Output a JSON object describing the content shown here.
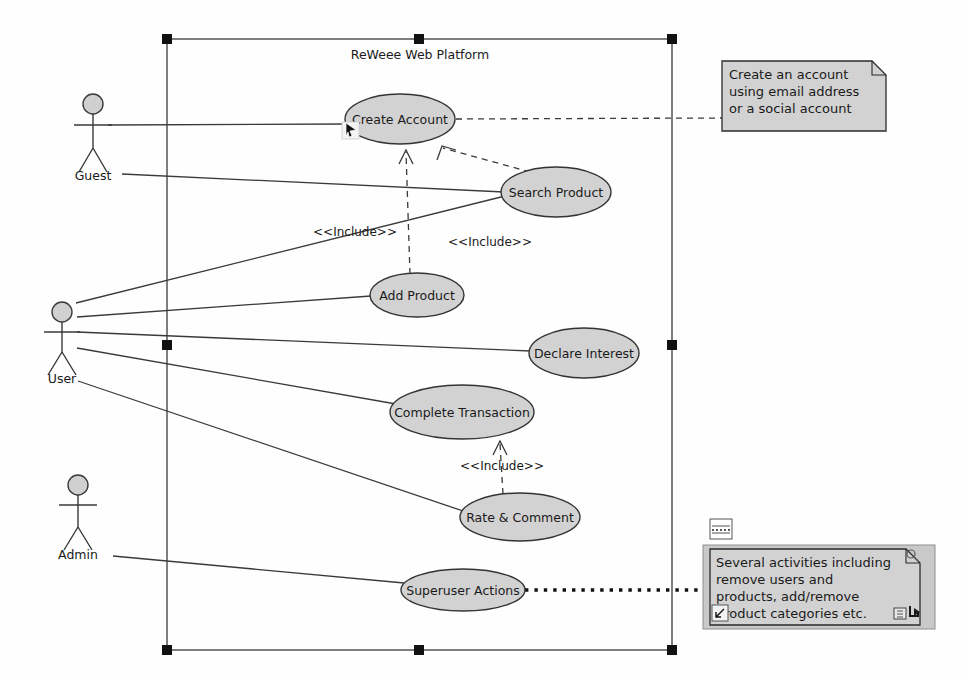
{
  "diagram": {
    "type": "uml-use-case-diagram",
    "system_boundary": {
      "title": "ReWeee Web Platform",
      "selected": true,
      "handles": 8
    },
    "actors": [
      {
        "id": "guest",
        "label": "Guest",
        "x": 93,
        "y": 98
      },
      {
        "id": "user",
        "label": "User",
        "x": 60,
        "y": 305
      },
      {
        "id": "admin",
        "label": "Admin",
        "x": 78,
        "y": 505
      }
    ],
    "use_cases": [
      {
        "id": "create-account",
        "label": "Create Account",
        "cx": 400,
        "cy": 119,
        "rx": 55,
        "ry": 25
      },
      {
        "id": "search-product",
        "label": "Search Product",
        "cx": 556,
        "cy": 192,
        "rx": 55,
        "ry": 25
      },
      {
        "id": "add-product",
        "label": "Add Product",
        "cx": 417,
        "cy": 295,
        "rx": 47,
        "ry": 22
      },
      {
        "id": "declare-interest",
        "label": "Declare Interest",
        "cx": 584,
        "cy": 353,
        "rx": 55,
        "ry": 25
      },
      {
        "id": "complete-transaction",
        "label": "Complete Transaction",
        "cx": 462,
        "cy": 412,
        "rx": 72,
        "ry": 27
      },
      {
        "id": "rate-comment",
        "label": "Rate & Comment",
        "cx": 520,
        "cy": 517,
        "rx": 60,
        "ry": 24
      },
      {
        "id": "superuser-actions",
        "label": "Superuser Actions",
        "cx": 463,
        "cy": 590,
        "rx": 62,
        "ry": 21
      }
    ],
    "include_labels": [
      {
        "id": "include-add-product-create-account",
        "text": "<<Include>>",
        "x": 355,
        "y": 232
      },
      {
        "id": "include-search-product-create-account",
        "text": "<<Include>>",
        "x": 490,
        "y": 242
      },
      {
        "id": "include-rate-comment-complete-transaction",
        "text": "<<Include>>",
        "x": 502,
        "y": 466
      }
    ],
    "associations": [
      {
        "from": "guest",
        "to": "create-account"
      },
      {
        "from": "guest",
        "to": "search-product"
      },
      {
        "from": "user",
        "to": "search-product"
      },
      {
        "from": "user",
        "to": "add-product"
      },
      {
        "from": "user",
        "to": "declare-interest"
      },
      {
        "from": "user",
        "to": "complete-transaction"
      },
      {
        "from": "user",
        "to": "rate-comment"
      },
      {
        "from": "admin",
        "to": "superuser-actions"
      }
    ],
    "includes": [
      {
        "from": "add-product",
        "to": "create-account"
      },
      {
        "from": "search-product",
        "to": "create-account"
      },
      {
        "from": "rate-comment",
        "to": "complete-transaction"
      }
    ],
    "notes": [
      {
        "id": "note-create-account",
        "attached_to": "create-account",
        "lines": [
          "Create an account",
          "using email address",
          "or a social account"
        ]
      },
      {
        "id": "note-superuser-actions",
        "attached_to": "superuser-actions",
        "lines": [
          "Several activities including",
          "remove users and",
          "products, add/remove",
          "product categories etc."
        ]
      }
    ],
    "cursor": {
      "id": "mouse-pointer",
      "x": 349,
      "y": 130
    },
    "colors": {
      "use_case_fill": "#d2d2d2",
      "note_fill": "#d2d2d2",
      "stroke": "#3a3a3a",
      "handle": "#111111",
      "background": "#ffffff"
    }
  }
}
